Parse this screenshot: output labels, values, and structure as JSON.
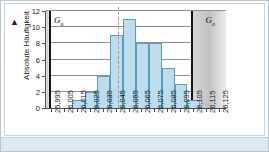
{
  "chart_data": {
    "type": "bar",
    "title": "",
    "xlabel": "",
    "ylabel": "Absolute Häufigkeit",
    "ylim": [
      0,
      12
    ],
    "ytick_labels": [
      "0",
      "2",
      "4",
      "6",
      "8",
      "10",
      "12"
    ],
    "ytick_values": [
      0,
      2,
      4,
      6,
      8,
      10,
      12
    ],
    "grid": true,
    "legend": "none",
    "categories": [
      "25,995",
      "26,005",
      "26,015",
      "26,025",
      "26,035",
      "26,045",
      "26,055",
      "26,065",
      "26,075",
      "26,085",
      "26,095",
      "26,105",
      "26,115",
      "26,125"
    ],
    "values": [
      0,
      0,
      1,
      2,
      4,
      9,
      11,
      8,
      8,
      5,
      3,
      1,
      0,
      0
    ],
    "bar_fill_color": "#bddded",
    "bar_border_color": "#5b9ec4",
    "annotations": {
      "lower_limit_label": "G",
      "lower_limit_sub": "u",
      "upper_limit_label": "G",
      "upper_limit_sub": "o",
      "mean_line": "dashed-vertical"
    }
  },
  "axes": {
    "y_title": "Absolute Häufigkeit",
    "y_arrow": "▲",
    "y_ticks": [
      "12",
      "10",
      "8",
      "6",
      "4",
      "2",
      "0"
    ],
    "x_ticks": [
      "25,995",
      "26,005",
      "26,015",
      "26,025",
      "26,035",
      "26,045",
      "26,055",
      "26,065",
      "26,075",
      "26,085",
      "26,095",
      "26,105",
      "26,115",
      "26,125"
    ]
  },
  "limits": {
    "lower": {
      "label": "G",
      "sub": "u"
    },
    "upper": {
      "label": "G",
      "sub": "o"
    }
  }
}
